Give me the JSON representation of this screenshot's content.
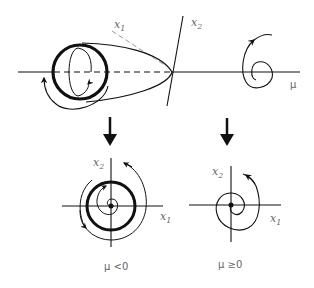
{
  "diagram": {
    "type": "bifurcation-diagram",
    "top": {
      "axis_labels": {
        "x1": {
          "base": "x",
          "sub": "1"
        },
        "x2": {
          "base": "x",
          "sub": "2"
        },
        "mu": "μ"
      }
    },
    "bottom_left": {
      "axis_labels": {
        "x1": {
          "base": "x",
          "sub": "1"
        },
        "x2": {
          "base": "x",
          "sub": "2"
        }
      },
      "caption": "μ <0"
    },
    "bottom_right": {
      "axis_labels": {
        "x1": {
          "base": "x",
          "sub": "1"
        },
        "x2": {
          "base": "x",
          "sub": "2"
        }
      },
      "caption": "μ ≥0"
    },
    "colors": {
      "stroke": "#111111",
      "label": "#666666",
      "dashed_axis": "#999999"
    }
  }
}
